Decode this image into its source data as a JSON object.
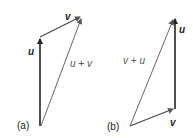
{
  "diagram": {
    "panel_a": {
      "label": "(a)",
      "vector_u_label": "u",
      "vector_v_label": "v",
      "sum_label": "u + v"
    },
    "panel_b": {
      "label": "(b)",
      "vector_u_label": "u",
      "vector_v_label": "v",
      "sum_label": "v + u"
    },
    "colors": {
      "vector": "#222222",
      "resultant": "#555555"
    }
  }
}
